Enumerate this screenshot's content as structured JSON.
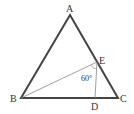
{
  "diagram": {
    "type": "geometry-triangle",
    "points": {
      "A": {
        "label": "A",
        "x": 70,
        "y": 15
      },
      "B": {
        "label": "B",
        "x": 21,
        "y": 98
      },
      "C": {
        "label": "C",
        "x": 118,
        "y": 98
      },
      "D": {
        "label": "D",
        "x": 95,
        "y": 98
      },
      "E": {
        "label": "E",
        "x": 97,
        "y": 62
      }
    },
    "angle_label": "60°",
    "colors": {
      "triangle": "#444444",
      "inner": "#777777",
      "text": "#333333"
    }
  }
}
